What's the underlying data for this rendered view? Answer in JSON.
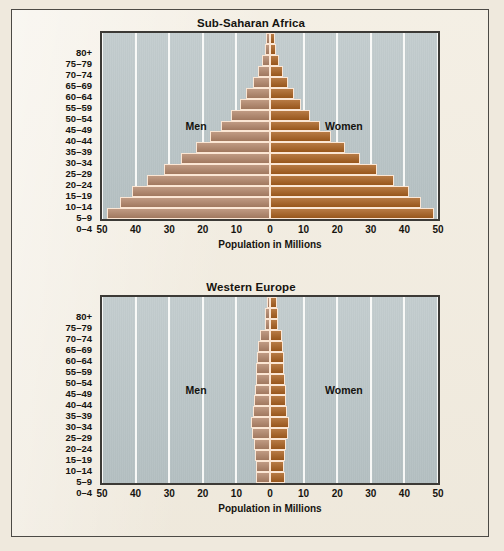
{
  "figure": {
    "page_background": "#efe9dd",
    "plot_background": "#b9c4c6",
    "gridline_color": "#fdfdfb",
    "men_color": "#b3866a",
    "women_color": "#a9601f"
  },
  "chart_data": [
    {
      "type": "bar",
      "subtype": "population-pyramid",
      "title": "Sub-Saharan Africa",
      "xlabel": "Population in Millions",
      "ylabel": "",
      "orientation": "horizontal",
      "grid": true,
      "grid_axis": "x",
      "legend_position": "in-plot",
      "xlim": [
        -50,
        50
      ],
      "xticks": [
        -50,
        -40,
        -30,
        -20,
        -10,
        0,
        10,
        20,
        30,
        40,
        50
      ],
      "xticklabels": [
        "50",
        "40",
        "30",
        "20",
        "10",
        "0",
        "10",
        "20",
        "30",
        "40",
        "50"
      ],
      "categories": [
        "80+",
        "75–79",
        "70–74",
        "65–69",
        "60–64",
        "55–59",
        "50–54",
        "45–49",
        "40–44",
        "35–39",
        "30–34",
        "25–29",
        "20–24",
        "15–19",
        "10–14",
        "5–9",
        "0–4"
      ],
      "series": [
        {
          "name": "Men",
          "side": "left",
          "color": "#b3866a",
          "values": [
            1.2,
            1.6,
            2.4,
            3.6,
            5.2,
            7.0,
            9.0,
            11.5,
            14.5,
            18.0,
            22.0,
            26.5,
            31.5,
            36.5,
            41.0,
            44.5,
            48.5
          ]
        },
        {
          "name": "Women",
          "side": "right",
          "color": "#a9601f",
          "values": [
            1.4,
            1.8,
            2.6,
            3.8,
            5.4,
            7.2,
            9.2,
            11.8,
            14.8,
            18.3,
            22.3,
            26.8,
            31.8,
            36.8,
            41.3,
            44.8,
            48.8
          ]
        }
      ]
    },
    {
      "type": "bar",
      "subtype": "population-pyramid",
      "title": "Western Europe",
      "xlabel": "Population in Millions",
      "ylabel": "",
      "orientation": "horizontal",
      "grid": true,
      "grid_axis": "x",
      "legend_position": "in-plot",
      "xlim": [
        -50,
        50
      ],
      "xticks": [
        -50,
        -40,
        -30,
        -20,
        -10,
        0,
        10,
        20,
        30,
        40,
        50
      ],
      "xticklabels": [
        "50",
        "40",
        "30",
        "20",
        "10",
        "0",
        "10",
        "20",
        "30",
        "40",
        "50"
      ],
      "categories": [
        "80+",
        "75–79",
        "70–74",
        "65–69",
        "60–64",
        "55–59",
        "50–54",
        "45–49",
        "40–44",
        "35–39",
        "30–34",
        "25–29",
        "20–24",
        "15–19",
        "10–14",
        "5–9",
        "0–4"
      ],
      "series": [
        {
          "name": "Men",
          "side": "left",
          "color": "#b3866a",
          "values": [
            0.9,
            1.5,
            1.6,
            3.0,
            3.6,
            4.0,
            4.1,
            4.3,
            4.6,
            4.8,
            5.2,
            5.6,
            5.5,
            4.9,
            4.4,
            4.2,
            4.3
          ]
        },
        {
          "name": "Women",
          "side": "right",
          "color": "#a9601f",
          "values": [
            2.2,
            2.4,
            2.3,
            3.6,
            4.0,
            4.3,
            4.3,
            4.4,
            4.7,
            4.9,
            5.2,
            5.6,
            5.4,
            4.9,
            4.5,
            4.3,
            4.4
          ]
        }
      ]
    }
  ]
}
